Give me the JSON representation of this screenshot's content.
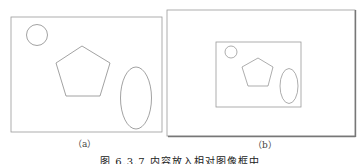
{
  "figure": {
    "caption": "图 6.3.7 内容放入相对图像框中",
    "panels": [
      {
        "label": "（a）",
        "frame": {
          "x": 11,
          "y": 17,
          "w": 151,
          "h": 115
        },
        "shapes": [
          "circle",
          "pentagon",
          "ellipse"
        ]
      },
      {
        "label": "（b）",
        "outer_frame": {
          "x": 167,
          "y": 10,
          "w": 188,
          "h": 126
        },
        "inner_frame": {
          "x": 216,
          "y": 42,
          "w": 85,
          "h": 65
        },
        "shapes": [
          "circle",
          "pentagon",
          "ellipse"
        ]
      }
    ],
    "colors": {
      "stroke": "#8a8a8a",
      "frame": "#9a9a9a",
      "shadow": "#777777"
    }
  }
}
